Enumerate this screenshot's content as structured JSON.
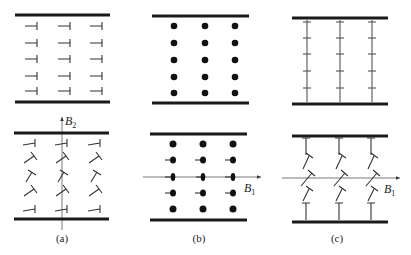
{
  "figure": {
    "panels": [
      {
        "id": "a",
        "caption": "(a)",
        "top_state": "rows of dislocation symbols, stem horizontal, all identical",
        "bottom_state": "dislocation symbols tilted in the middle rows",
        "field_axis": {
          "label": "B",
          "subscript": "2",
          "direction": "vertical"
        }
      },
      {
        "id": "b",
        "caption": "(b)",
        "top_state": "rows of solid dots",
        "bottom_state": "solid dots, middle rows with short horizontal tails",
        "field_axis": {
          "label": "B",
          "subscript": "1",
          "direction": "horizontal"
        }
      },
      {
        "id": "c",
        "caption": "(c)",
        "top_state": "vertical columns of T-shaped symbols",
        "bottom_state": "T-shaped symbols tilted in the middle rows",
        "field_axis": {
          "label": "B",
          "subscript": "1",
          "direction": "horizontal"
        }
      }
    ],
    "grid": {
      "rows": 5,
      "columns": 3
    },
    "colors": {
      "ink": "#1a1a1a",
      "axis": "#555555",
      "background": "#ffffff"
    }
  }
}
